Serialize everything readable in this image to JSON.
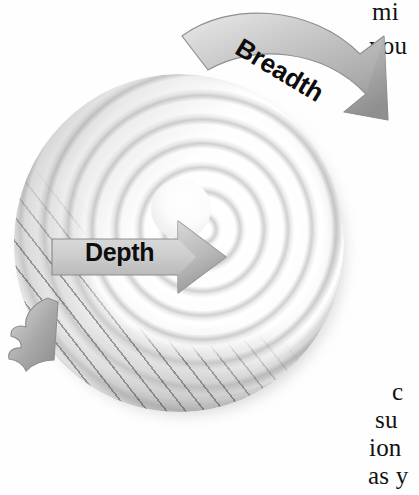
{
  "figure": {
    "type": "concentric-spiral-disk-diagram",
    "background_color": "#ffffff"
  },
  "labels": {
    "depth": "Depth",
    "breadth": "Breadth"
  },
  "arrows": {
    "depth": {
      "name": "depth-arrow",
      "direction": "right",
      "shape": "straight",
      "fill_color": "#c6c6c6",
      "edge_color": "#8f8f8f",
      "points_to": "spiral-center"
    },
    "breadth": {
      "name": "breadth-arrow",
      "direction": "clockwise",
      "shape": "curved",
      "fill_color": "#b9b9b9",
      "edge_color": "#909090",
      "points_to": "outer-rim"
    }
  },
  "spiral": {
    "ring_count": 7,
    "center_dome": true,
    "hatched_cutaway_edge": true,
    "highlight_color": "#ffffff",
    "shade_color": "#8a8a8a",
    "rim_color": "#b9b9b9"
  },
  "page_text": {
    "top_right": [
      "mi",
      "you"
    ],
    "bottom_right": [
      "c",
      "su",
      "ion",
      "as y"
    ]
  }
}
